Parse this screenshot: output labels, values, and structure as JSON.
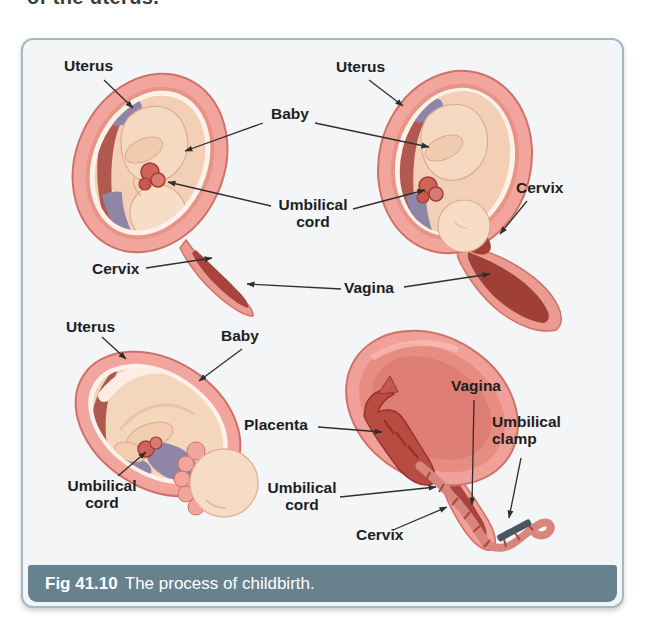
{
  "page_text": {
    "top_partial": "of the uterus."
  },
  "figure": {
    "caption": {
      "number": "Fig 41.10",
      "title": "The process of childbirth."
    },
    "stage1": {
      "uterus": "Uterus",
      "cervix": "Cervix"
    },
    "stage2": {
      "uterus": "Uterus",
      "cervix": "Cervix"
    },
    "shared": {
      "baby": "Baby",
      "umbilical_line1": "Umbilical",
      "umbilical_line2": "cord",
      "vagina": "Vagina"
    },
    "stage3": {
      "uterus": "Uterus",
      "baby": "Baby",
      "umbilical_line1": "Umbilical",
      "umbilical_line2": "cord"
    },
    "stage4": {
      "placenta": "Placenta",
      "umbilical_line1": "Umbilical",
      "umbilical_line2": "cord",
      "cervix": "Cervix",
      "vagina": "Vagina",
      "clamp_line1": "Umbilical",
      "clamp_line2": "clamp"
    },
    "colors": {
      "caption_bar": "#68818f",
      "caption_text": "#ffffff",
      "panel_border": "#a4b9c2",
      "panel_bg": "#f3f5f6",
      "uterus_wall": "#f1a59d",
      "uterus_wall_stroke": "#cf7168",
      "amnion_white": "#fdf2e9",
      "interior_skin": "#f3cfb6",
      "baby_skin": "#f6dcc4",
      "fluid_purple": "#8e85a7",
      "lining_maroon": "#b2594f",
      "deep_red": "#a8443b",
      "cord_red": "#ce645c",
      "placenta_red": "#b84c43",
      "clamp_gray": "#4b5560",
      "label_text": "#1e1e1e",
      "leader_line": "#2f2f2f"
    }
  }
}
